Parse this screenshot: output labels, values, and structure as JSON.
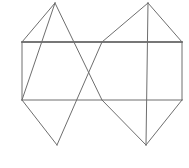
{
  "canvas": {
    "width": 189,
    "height": 168,
    "background_color": "#ffffff",
    "title": "Overlapping squares geometric net"
  },
  "style": {
    "stroke_color": "#6e6e6e",
    "stroke_color_dark": "#4a4a4a",
    "stroke_width": 1,
    "stroke_width_emphasis": 1.6,
    "fill": "none"
  },
  "figure": {
    "rectangle": {
      "name": "central-rectangle",
      "left": 22,
      "top": 42,
      "right": 182,
      "bottom": 100,
      "width": 160,
      "height": 58,
      "corners": [
        {
          "label": "top-left",
          "x": 22,
          "y": 42
        },
        {
          "label": "top-right",
          "x": 182,
          "y": 42
        },
        {
          "label": "bottom-right",
          "x": 182,
          "y": 100
        },
        {
          "label": "bottom-left",
          "x": 22,
          "y": 100
        }
      ]
    },
    "diamonds": [
      {
        "name": "left-diamond",
        "vertices": [
          {
            "label": "top",
            "x": 55,
            "y": 3
          },
          {
            "label": "right",
            "x": 102,
            "y": 100
          },
          {
            "label": "bottom",
            "x": 57,
            "y": 145
          },
          {
            "label": "left",
            "x": 22,
            "y": 42
          }
        ]
      },
      {
        "name": "right-diamond",
        "vertices": [
          {
            "label": "top",
            "x": 148,
            "y": 3
          },
          {
            "label": "right",
            "x": 182,
            "y": 42
          },
          {
            "label": "bottom",
            "x": 146,
            "y": 145
          },
          {
            "label": "left",
            "x": 102,
            "y": 42
          }
        ]
      },
      {
        "name": "left-lower-diamond",
        "vertices": [
          {
            "label": "top",
            "x": 55,
            "y": 3
          },
          {
            "label": "right",
            "x": 102,
            "y": 42
          },
          {
            "label": "bottom",
            "x": 57,
            "y": 145
          },
          {
            "label": "left",
            "x": 22,
            "y": 100
          }
        ]
      },
      {
        "name": "right-lower-diamond",
        "vertices": [
          {
            "label": "top",
            "x": 148,
            "y": 3
          },
          {
            "label": "right",
            "x": 182,
            "y": 100
          },
          {
            "label": "bottom",
            "x": 146,
            "y": 145
          },
          {
            "label": "left",
            "x": 102,
            "y": 100
          }
        ]
      }
    ],
    "segments": [
      {
        "name": "rect-top-edge",
        "x1": 22,
        "y1": 42,
        "x2": 182,
        "y2": 42,
        "emphasis": true
      },
      {
        "name": "rect-bottom-edge",
        "x1": 22,
        "y1": 100,
        "x2": 182,
        "y2": 100,
        "emphasis": false
      },
      {
        "name": "rect-left-edge",
        "x1": 22,
        "y1": 42,
        "x2": 22,
        "y2": 100,
        "emphasis": false
      },
      {
        "name": "rect-right-edge",
        "x1": 182,
        "y1": 42,
        "x2": 182,
        "y2": 100,
        "emphasis": false
      },
      {
        "name": "diag-left-top-up",
        "x1": 22,
        "y1": 42,
        "x2": 55,
        "y2": 3,
        "emphasis": false
      },
      {
        "name": "diag-left-top-down",
        "x1": 55,
        "y1": 3,
        "x2": 102,
        "y2": 100,
        "emphasis": false
      },
      {
        "name": "diag-left-bottom-down",
        "x1": 22,
        "y1": 100,
        "x2": 57,
        "y2": 145,
        "emphasis": false
      },
      {
        "name": "diag-left-bottom-up",
        "x1": 57,
        "y1": 145,
        "x2": 102,
        "y2": 42,
        "emphasis": false
      },
      {
        "name": "diag-left-cross-up",
        "x1": 22,
        "y1": 100,
        "x2": 55,
        "y2": 3,
        "emphasis": false
      },
      {
        "name": "diag-right-top-up",
        "x1": 102,
        "y1": 42,
        "x2": 148,
        "y2": 3,
        "emphasis": false
      },
      {
        "name": "diag-right-top-down",
        "x1": 148,
        "y1": 3,
        "x2": 182,
        "y2": 42,
        "emphasis": false
      },
      {
        "name": "diag-right-down-long",
        "x1": 148,
        "y1": 3,
        "x2": 146,
        "y2": 145,
        "emphasis": false
      },
      {
        "name": "diag-right-bottom-left",
        "x1": 146,
        "y1": 145,
        "x2": 102,
        "y2": 100,
        "emphasis": false
      },
      {
        "name": "diag-right-bottom-right",
        "x1": 146,
        "y1": 145,
        "x2": 182,
        "y2": 100,
        "emphasis": false
      }
    ],
    "crossing_points": [
      {
        "name": "crossing-top-center",
        "x": 102,
        "y": 42
      },
      {
        "name": "crossing-left",
        "x": 58,
        "y": 71
      },
      {
        "name": "crossing-right",
        "x": 144,
        "y": 71
      },
      {
        "name": "crossing-bottom-center",
        "x": 102,
        "y": 100
      }
    ]
  }
}
